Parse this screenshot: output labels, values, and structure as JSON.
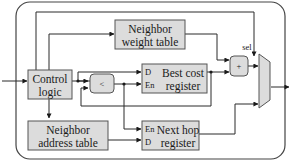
{
  "diagram": {
    "blocks": {
      "control_logic": {
        "line1": "Control",
        "line2": "logic"
      },
      "neighbor_weight_table": {
        "line1": "Neighbor",
        "line2": "weight table"
      },
      "best_cost_register": {
        "line1": "Best cost",
        "line2": "register",
        "port_d": "D",
        "port_en": "En"
      },
      "neighbor_address_table": {
        "line1": "Neighbor",
        "line2": "address table"
      },
      "next_hop_register": {
        "line1": "Next hop",
        "line2": "register",
        "port_en": "En",
        "port_d": "D"
      },
      "comparator": {
        "symbol": "<"
      },
      "adder": {
        "symbol": "+"
      },
      "mux": {
        "select_label": "sel"
      }
    },
    "colors": {
      "block_fill": "#dcdcdc",
      "block_stroke": "#555555",
      "wire": "#2a2a2a",
      "background": "#ffffff"
    }
  }
}
